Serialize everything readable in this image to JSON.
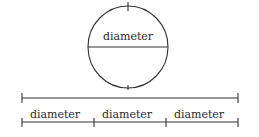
{
  "figure": {
    "title": "",
    "ink_color": "#333333",
    "background_color": "#ffffff",
    "circle": {
      "diameter_label": "diameter",
      "center_x": 128,
      "center_y": 47,
      "radius_x": 40,
      "radius_y": 41,
      "tick_top": true,
      "tick_bottom": true,
      "chord_drawn": true
    },
    "ruler": {
      "left_x": 22,
      "right_x": 238,
      "top_line_y": 98,
      "bottom_line_y": 122,
      "segments": [
        {
          "label": "diameter",
          "start_x": 22,
          "end_x": 94
        },
        {
          "label": "diameter",
          "start_x": 94,
          "end_x": 166
        },
        {
          "label": "diameter",
          "start_x": 166,
          "end_x": 238
        }
      ],
      "tick_positions": [
        94,
        166,
        238
      ],
      "end_cap_left": true,
      "end_cap_right": true
    }
  }
}
